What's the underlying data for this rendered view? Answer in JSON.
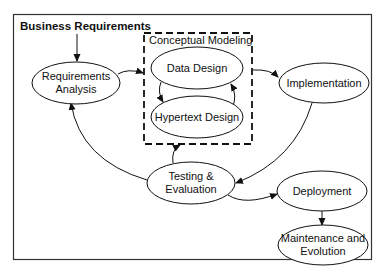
{
  "diagram": {
    "title": "Business Requirements",
    "group_label": "Conceptual Modeling",
    "nodes": {
      "requirements_analysis": [
        "Requirements",
        "Analysis"
      ],
      "data_design": [
        "Data Design"
      ],
      "hypertext_design": [
        "Hypertext Design"
      ],
      "implementation": [
        "Implementation"
      ],
      "testing_evaluation": [
        "Testing &",
        "Evaluation"
      ],
      "deployment": [
        "Deployment"
      ],
      "maintenance_evolution": [
        "Maintenance and",
        "Evolution"
      ]
    },
    "edges": [
      {
        "from": "Business Requirements",
        "to": "Requirements Analysis"
      },
      {
        "from": "Requirements Analysis",
        "to": "Conceptual Modeling"
      },
      {
        "from": "Data Design",
        "to": "Hypertext Design"
      },
      {
        "from": "Hypertext Design",
        "to": "Data Design"
      },
      {
        "from": "Conceptual Modeling",
        "to": "Implementation"
      },
      {
        "from": "Implementation",
        "to": "Testing & Evaluation"
      },
      {
        "from": "Testing & Evaluation",
        "to": "Conceptual Modeling"
      },
      {
        "from": "Testing & Evaluation",
        "to": "Requirements Analysis"
      },
      {
        "from": "Testing & Evaluation",
        "to": "Deployment"
      },
      {
        "from": "Deployment",
        "to": "Maintenance and Evolution"
      }
    ],
    "colors": {
      "stroke": "#111111",
      "background": "#ffffff"
    }
  }
}
